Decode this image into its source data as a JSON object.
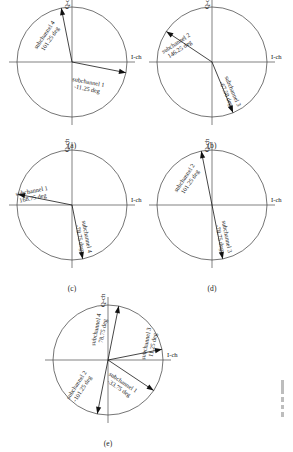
{
  "figure": {
    "type": "phasor-constellation-diagrams",
    "panel_count": 5,
    "axis_labels": {
      "i": "I-ch",
      "q": "Q-ch"
    }
  },
  "panels": [
    {
      "id": "a",
      "caption": "(a)",
      "center": {
        "x": 72,
        "y": 62
      },
      "radius": 55,
      "axes": {
        "i": "I-ch",
        "q": "Q-ch"
      },
      "vectors": [
        {
          "name": "subchannel 4",
          "angle_text": "101.25 deg",
          "angle_deg": 101.25,
          "label_lines": [
            "subchannel 4",
            "101.25 deg"
          ],
          "label_rotation": -56,
          "label_x": -26,
          "label_y": -26
        },
        {
          "name": "subchannel 1",
          "angle_text": "-11.25 deg",
          "angle_deg": -11.25,
          "label_lines": [
            "subchannel 1",
            "-11.25 deg"
          ],
          "label_rotation": 11,
          "label_x": 16,
          "label_y": 22
        }
      ]
    },
    {
      "id": "b",
      "caption": "(b)",
      "center": {
        "x": 212,
        "y": 62
      },
      "radius": 55,
      "axes": {
        "i": "I-ch",
        "q": "Q-ch"
      },
      "vectors": [
        {
          "name": "subchannel 2",
          "angle_text": "146.25 deg",
          "angle_deg": 146.25,
          "label_lines": [
            "subchannel 2",
            "146.25 deg"
          ],
          "label_rotation": -33,
          "label_x": -35,
          "label_y": -17
        },
        {
          "name": "subchannel 3",
          "angle_text": "-67.50 deg",
          "angle_deg": -67.5,
          "label_lines": [
            "subchannel 3",
            "-67.50 deg"
          ],
          "label_rotation": 67,
          "label_x": 19,
          "label_y": 30
        }
      ]
    },
    {
      "id": "c",
      "caption": "(c)",
      "center": {
        "x": 72,
        "y": 205
      },
      "radius": 55,
      "axes": {
        "i": "I-ch",
        "q": "Q-ch"
      },
      "vectors": [
        {
          "name": "subchannel 1",
          "angle_text": "168.75 deg",
          "angle_deg": 168.75,
          "label_lines": [
            "subchannel 1",
            "168.75 deg"
          ],
          "label_rotation": -11,
          "label_x": -40,
          "label_y": -12
        },
        {
          "name": "subchannel 4",
          "angle_text": "-78.75 deg",
          "angle_deg": -78.75,
          "label_lines": [
            "subchannel 4",
            "-78.75 deg"
          ],
          "label_rotation": 79,
          "label_x": 13,
          "label_y": 32
        }
      ]
    },
    {
      "id": "d",
      "caption": "(d)",
      "center": {
        "x": 212,
        "y": 205
      },
      "radius": 55,
      "axes": {
        "i": "I-ch",
        "q": "Q-ch"
      },
      "vectors": [
        {
          "name": "subchannel 2",
          "angle_text": "101.25 deg",
          "angle_deg": 101.25,
          "label_lines": [
            "subchannel 2",
            "101.25 deg"
          ],
          "label_rotation": -56,
          "label_x": -26,
          "label_y": -26
        },
        {
          "name": "subchannel 3",
          "angle_text": "-78.75 deg",
          "angle_deg": -78.75,
          "label_lines": [
            "subchannel 3",
            "-78.75 deg"
          ],
          "label_rotation": 79,
          "label_x": 13,
          "label_y": 32
        }
      ]
    },
    {
      "id": "e",
      "caption": "(e)",
      "center": {
        "x": 108,
        "y": 360
      },
      "radius": 55,
      "axes": {
        "i": "I-ch",
        "q": "Q-ch"
      },
      "vectors": [
        {
          "name": "subchannel 4",
          "angle_text": "78.75 deg",
          "angle_deg": 78.75,
          "label_lines": [
            "subchannel 4",
            "78.75 deg"
          ],
          "label_rotation": -79,
          "label_x": -10,
          "label_y": -30
        },
        {
          "name": "subchannel 3",
          "angle_text": "11.25 deg",
          "angle_deg": 11.25,
          "label_lines": [
            "subchannel 3",
            "11.25 deg"
          ],
          "label_rotation": -79,
          "label_x": 40,
          "label_y": -16
        },
        {
          "name": "subchannel 2",
          "angle_text": "-101.25 deg",
          "angle_deg": -101.25,
          "label_lines": [
            "subchannel 2",
            "-101.25 deg"
          ],
          "label_rotation": -57,
          "label_x": -30,
          "label_y": 26
        },
        {
          "name": "subchannel 1",
          "angle_text": "-33.75 deg",
          "angle_deg": -33.75,
          "label_lines": [
            "subchannel 1",
            "-33.75 deg"
          ],
          "label_rotation": 34,
          "label_x": 14,
          "label_y": 24
        }
      ]
    }
  ]
}
